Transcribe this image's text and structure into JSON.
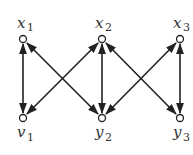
{
  "diagram": {
    "type": "bipartite-graph",
    "nodes": [
      {
        "id": "x1",
        "base": "x",
        "sub": "1",
        "x": 23,
        "y": 39,
        "label_pos": "above"
      },
      {
        "id": "x2",
        "base": "x",
        "sub": "2",
        "x": 102,
        "y": 39,
        "label_pos": "above"
      },
      {
        "id": "x3",
        "base": "x",
        "sub": "3",
        "x": 180,
        "y": 39,
        "label_pos": "above"
      },
      {
        "id": "y1",
        "base": "y",
        "sub": "1",
        "x": 23,
        "y": 118,
        "label_pos": "below"
      },
      {
        "id": "y2",
        "base": "y",
        "sub": "2",
        "x": 102,
        "y": 118,
        "label_pos": "below"
      },
      {
        "id": "y3",
        "base": "y",
        "sub": "3",
        "x": 180,
        "y": 118,
        "label_pos": "below"
      }
    ],
    "edges": [
      {
        "from": "x1",
        "to": "y1",
        "bidirectional": true
      },
      {
        "from": "x1",
        "to": "y2",
        "bidirectional": true
      },
      {
        "from": "x2",
        "to": "y1",
        "bidirectional": true
      },
      {
        "from": "x2",
        "to": "y2",
        "bidirectional": true
      },
      {
        "from": "x2",
        "to": "y3",
        "bidirectional": true
      },
      {
        "from": "x3",
        "to": "y2",
        "bidirectional": true
      },
      {
        "from": "x3",
        "to": "y3",
        "bidirectional": true
      }
    ],
    "colors": {
      "stroke": "#222222",
      "node_fill": "#ffffff"
    }
  },
  "labels": {
    "x1": {
      "base": "x",
      "sub": "1"
    },
    "x2": {
      "base": "x",
      "sub": "2"
    },
    "x3": {
      "base": "x",
      "sub": "3"
    },
    "y1": {
      "base": "v",
      "sub": "1"
    },
    "y2": {
      "base": "y",
      "sub": "2"
    },
    "y3": {
      "base": "y",
      "sub": "3"
    }
  }
}
